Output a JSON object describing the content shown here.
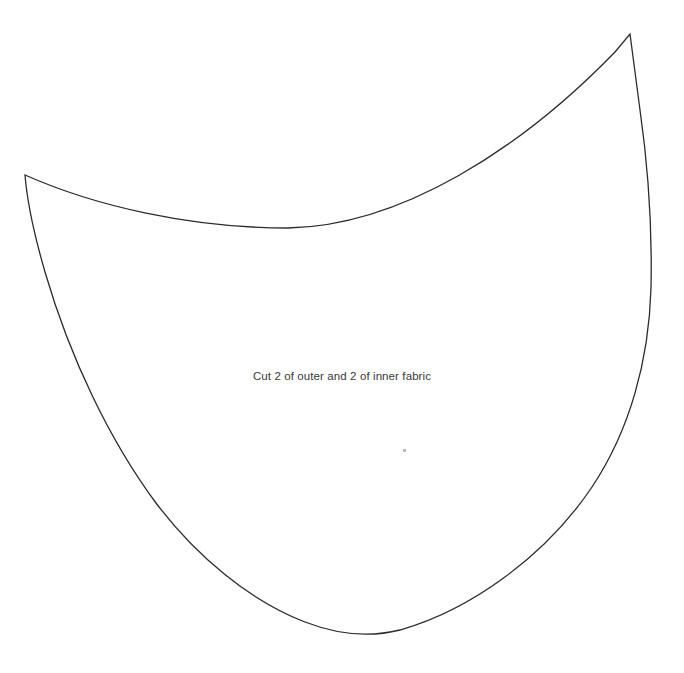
{
  "document": {
    "title": "Face Mask Sewing Pattern Template",
    "background_color": "#ffffff",
    "width": 684,
    "height": 673
  },
  "pattern": {
    "name": "mask-panel-outline",
    "label_text": "Cut 2 of outer and 2 of inner fabric",
    "stroke_color": "#2b2b2b",
    "fill_color": "#ffffff",
    "stroke_width": 1.3,
    "path": "M 25 175 C 95 206 190 228 288 228 C 400 226 520 150 615 52 L 630 34 L 640 110 C 650 180 652 240 651 288 C 649 360 630 430 592 487 C 545 557 470 610 400 630 C 368 638 336 634 305 622 C 250 601 196 556 156 503 C 110 441 70 358 45 272 C 34 234 27 200 25 175 Z",
    "cusps": [
      {
        "name": "left-cusp",
        "x": 25,
        "y": 175
      },
      {
        "name": "top-right-cusp",
        "x": 630,
        "y": 34
      }
    ],
    "extents": {
      "leftmost_x": 25,
      "rightmost_x": 651,
      "topmost_y": 34,
      "bottommost_y": 633
    }
  },
  "marks": [
    {
      "name": "stray-speck",
      "x": 403,
      "y": 449,
      "color": "#9a9a9a"
    }
  ]
}
